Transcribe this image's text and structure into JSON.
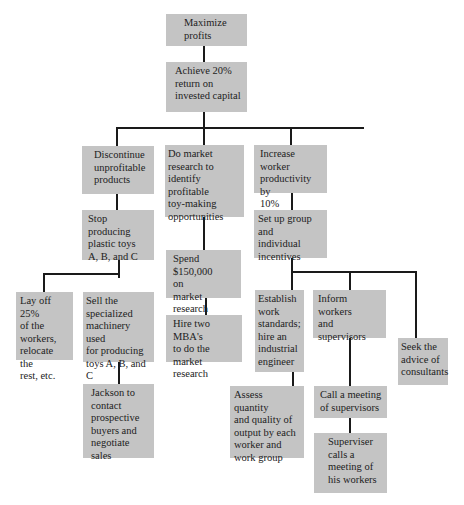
{
  "diagram": {
    "type": "goal hierarchy / means-end chain",
    "nodes": {
      "root": {
        "lines": [
          "Maximize",
          "profits"
        ]
      },
      "level1": {
        "lines": [
          "Achieve 20%",
          "return on",
          "invested capital"
        ]
      },
      "discontinue": {
        "lines": [
          "Discontinue",
          "unprofitable",
          "products"
        ]
      },
      "market_research": {
        "lines": [
          "Do market",
          "research to",
          "identify profitable",
          "toy-making",
          "opportunities"
        ]
      },
      "productivity": {
        "lines": [
          "Increase worker",
          "productivity by",
          "10%"
        ]
      },
      "stop_producing": {
        "lines": [
          "Stop producing",
          "plastic toys",
          "A, B, and C"
        ]
      },
      "spend": {
        "lines": [
          "Spend $150,000",
          "on",
          "market research"
        ]
      },
      "incentives": {
        "lines": [
          "Set up group and",
          "individual",
          "incentives"
        ]
      },
      "layoff": {
        "lines": [
          "Lay off 25%",
          "of the",
          "workers,",
          "relocate the",
          "rest, etc."
        ]
      },
      "sell_machinery": {
        "lines": [
          "Sell the",
          "specialized",
          "machinery used",
          "for producing",
          "toys A, B, and C"
        ]
      },
      "hire_mbas": {
        "lines": [
          "Hire two MBA's",
          "to do the market",
          "research"
        ]
      },
      "work_standards": {
        "lines": [
          "Establish",
          "work",
          "standards;",
          "hire an",
          "industrial",
          "engineer"
        ]
      },
      "inform": {
        "lines": [
          "Inform workers",
          "and",
          "supervisors"
        ]
      },
      "consultants": {
        "lines": [
          "Seek the",
          "advice of",
          "consultants"
        ]
      },
      "jackson": {
        "lines": [
          "Jackson to",
          "contact",
          "prospective",
          "buyers and",
          "negotiate sales"
        ]
      },
      "assess": {
        "lines": [
          "Assess quantity",
          "and quality of",
          "output by each",
          "worker and",
          "work group"
        ]
      },
      "call_meeting": {
        "lines": [
          "Call a meeting",
          "of supervisors"
        ]
      },
      "supervisor_meeting": {
        "lines": [
          "Superviser",
          "calls a",
          "meeting of",
          "his workers"
        ]
      }
    },
    "colors": {
      "box": "#c4c4c4",
      "line": "#1a1a1a",
      "background": "#ffffff"
    }
  }
}
